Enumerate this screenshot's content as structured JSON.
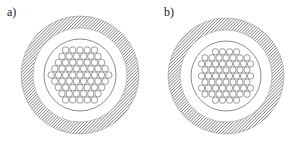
{
  "panels": [
    {
      "label": "a)",
      "label_pos": [
        7,
        5
      ],
      "center": [
        80,
        75
      ],
      "outer_ring": {
        "r_outer": 59,
        "r_inner": 47
      },
      "inner_circle_r": 36,
      "bundle": {
        "shape": "hexagonal",
        "rows": [
          5,
          6,
          7,
          8,
          9,
          8,
          7,
          6,
          5
        ],
        "fiber_d": 7.2
      }
    },
    {
      "label": "b)",
      "label_pos": [
        164,
        5
      ],
      "center": [
        226,
        76
      ],
      "outer_ring": {
        "r_outer": 58,
        "r_inner": 46
      },
      "inner_circle_r": 35,
      "bundle": {
        "shape": "circular",
        "rows": [
          4,
          7,
          8,
          7,
          8,
          7,
          8,
          7,
          4
        ],
        "fiber_d": 7.0
      }
    }
  ],
  "colors": {
    "stroke": "#707070",
    "hatch": "#555555",
    "background": "#ffffff"
  }
}
